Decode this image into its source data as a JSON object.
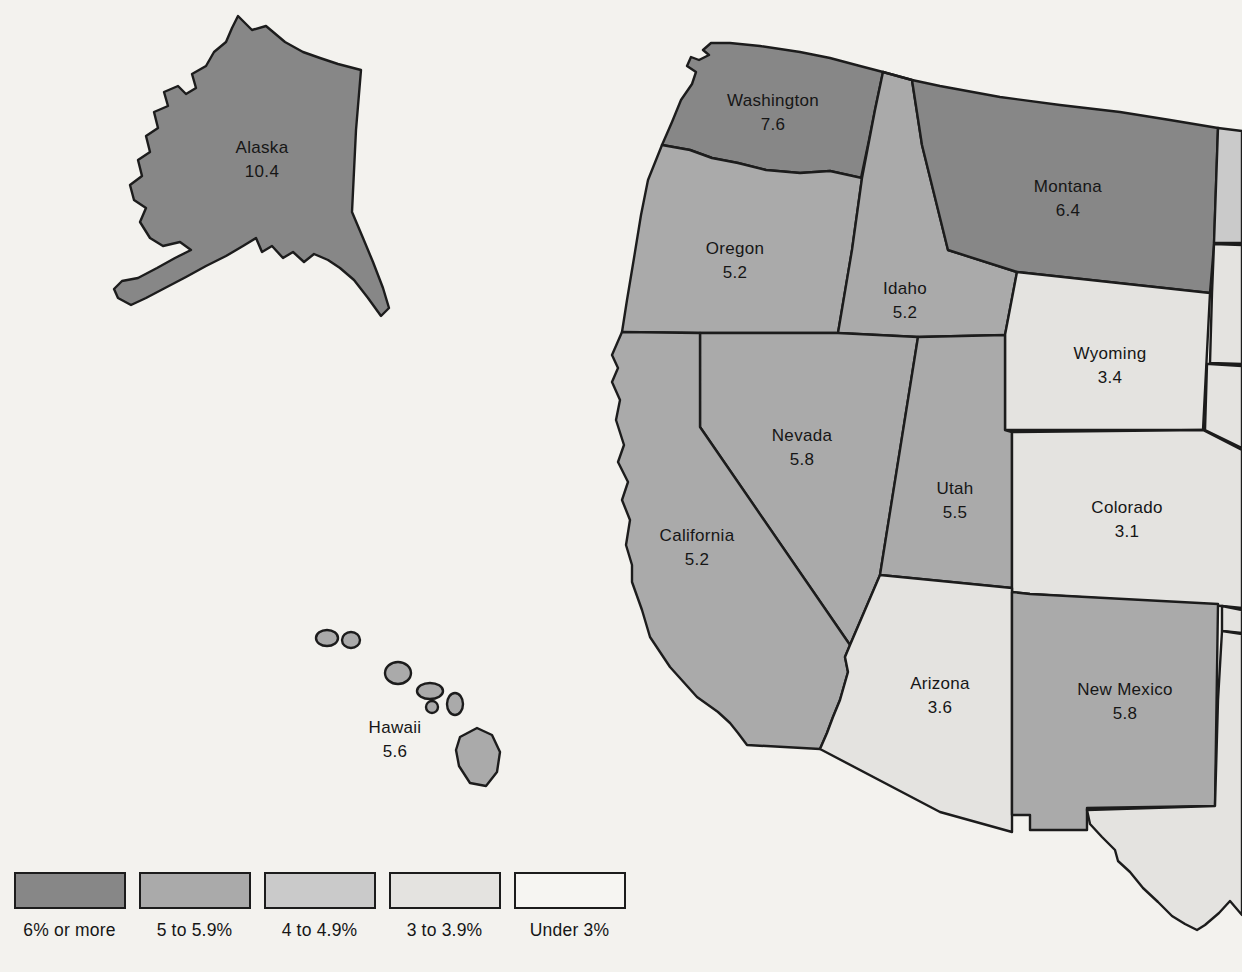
{
  "page": {
    "background": "#f3f2ee",
    "ink": "#1c1c1c",
    "label_color": "#161616"
  },
  "categories": {
    "band1": "#878787",
    "band2": "#aaaaaa",
    "band3": "#cacaca",
    "band4": "#e4e3e0",
    "band5": "#f6f5f2"
  },
  "map": {
    "states": [
      {
        "id": "alaska",
        "name": "Alaska",
        "value": "10.4",
        "category": "band1"
      },
      {
        "id": "washington",
        "name": "Washington",
        "value": "7.6",
        "category": "band1"
      },
      {
        "id": "montana",
        "name": "Montana",
        "value": "6.4",
        "category": "band1"
      },
      {
        "id": "oregon",
        "name": "Oregon",
        "value": "5.2",
        "category": "band2"
      },
      {
        "id": "idaho",
        "name": "Idaho",
        "value": "5.2",
        "category": "band2"
      },
      {
        "id": "wyoming",
        "name": "Wyoming",
        "value": "3.4",
        "category": "band4"
      },
      {
        "id": "nevada",
        "name": "Nevada",
        "value": "5.8",
        "category": "band2"
      },
      {
        "id": "utah",
        "name": "Utah",
        "value": "5.5",
        "category": "band2"
      },
      {
        "id": "colorado",
        "name": "Colorado",
        "value": "3.1",
        "category": "band4"
      },
      {
        "id": "california",
        "name": "California",
        "value": "5.2",
        "category": "band2"
      },
      {
        "id": "arizona",
        "name": "Arizona",
        "value": "3.6",
        "category": "band4"
      },
      {
        "id": "new-mexico",
        "name": "New Mexico",
        "value": "5.8",
        "category": "band2"
      },
      {
        "id": "hawaii",
        "name": "Hawaii",
        "value": "5.6",
        "category": "band2"
      }
    ],
    "edge_fragments": [
      {
        "id": "north-dakota-edge",
        "category": "band3"
      },
      {
        "id": "south-dakota-edge",
        "category": "band4"
      },
      {
        "id": "nebraska-edge",
        "category": "band4"
      },
      {
        "id": "oklahoma-panhandle-edge",
        "category": "band4"
      },
      {
        "id": "texas-edge",
        "category": "band4"
      }
    ]
  },
  "legend": {
    "items": [
      {
        "label": "6% or more",
        "color": "#878787"
      },
      {
        "label": "5 to 5.9%",
        "color": "#aaaaaa"
      },
      {
        "label": "4 to 4.9%",
        "color": "#cacaca"
      },
      {
        "label": "3 to 3.9%",
        "color": "#e4e3e0"
      },
      {
        "label": "Under 3%",
        "color": "#f6f5f2"
      }
    ]
  }
}
